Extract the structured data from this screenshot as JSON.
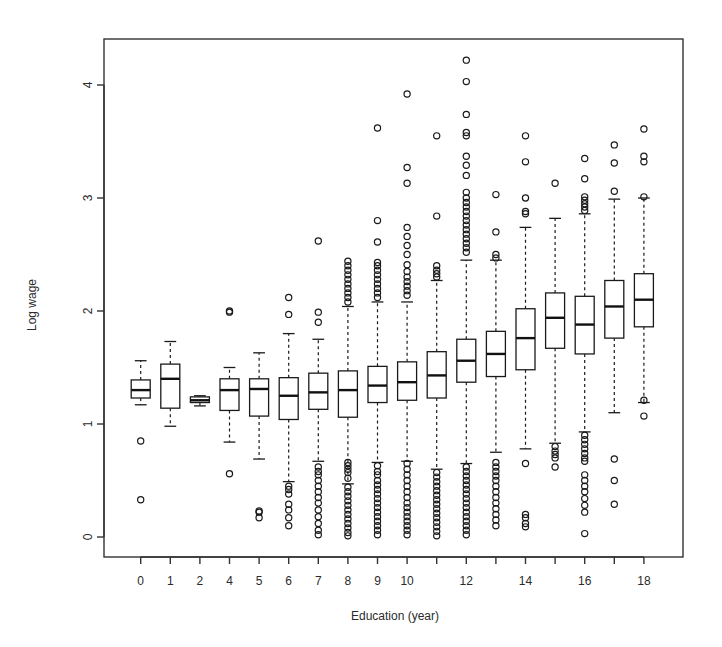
{
  "chart_data": {
    "type": "box",
    "title": "",
    "xlabel": "Education (year)",
    "ylabel": "Log wage",
    "grid": false,
    "legend": "none",
    "xlim": [
      -0.6,
      17.6
    ],
    "ylim": [
      -0.12,
      4.4
    ],
    "ytick_values": [
      0,
      1,
      2,
      3,
      4
    ],
    "ytick_labels": [
      "0",
      "1",
      "2",
      "3",
      "4"
    ],
    "categories": [
      "0",
      "1",
      "2",
      "4",
      "5",
      "6",
      "7",
      "8",
      "9",
      "10",
      "11",
      "12",
      "13",
      "14",
      "15",
      "16",
      "17",
      "18"
    ],
    "xtick_labels_shown": [
      "0",
      "1",
      "2",
      "4",
      "5",
      "6",
      "7",
      "8",
      "9",
      "10",
      "",
      "12",
      "",
      "14",
      "",
      "16",
      "",
      "18"
    ],
    "boxes": [
      {
        "category": "0",
        "whisker_low": 1.17,
        "q1": 1.23,
        "median": 1.3,
        "q3": 1.39,
        "whisker_high": 1.56,
        "outliers": [
          0.85,
          0.33
        ]
      },
      {
        "category": "1",
        "whisker_low": 0.98,
        "q1": 1.14,
        "median": 1.4,
        "q3": 1.53,
        "whisker_high": 1.73,
        "outliers": []
      },
      {
        "category": "2",
        "whisker_low": 1.16,
        "q1": 1.19,
        "median": 1.21,
        "q3": 1.24,
        "whisker_high": 1.25,
        "outliers": []
      },
      {
        "category": "4",
        "whisker_low": 0.84,
        "q1": 1.12,
        "median": 1.3,
        "q3": 1.4,
        "whisker_high": 1.5,
        "outliers": [
          2.0,
          1.99,
          0.56
        ]
      },
      {
        "category": "5",
        "whisker_low": 0.69,
        "q1": 1.07,
        "median": 1.31,
        "q3": 1.4,
        "whisker_high": 1.63,
        "outliers": [
          0.23,
          0.22,
          0.17
        ]
      },
      {
        "category": "6",
        "whisker_low": 0.49,
        "q1": 1.04,
        "median": 1.25,
        "q3": 1.41,
        "whisker_high": 1.8,
        "outliers": [
          2.12,
          1.97,
          0.45,
          0.42,
          0.38,
          0.29,
          0.24,
          0.17,
          0.1
        ]
      },
      {
        "category": "7",
        "whisker_low": 0.67,
        "q1": 1.13,
        "median": 1.28,
        "q3": 1.45,
        "whisker_high": 1.75,
        "outliers": [
          2.62,
          1.99,
          1.9,
          0.62,
          0.58,
          0.55,
          0.5,
          0.45,
          0.4,
          0.35,
          0.3,
          0.24,
          0.18,
          0.12,
          0.06,
          0.02
        ]
      },
      {
        "category": "8",
        "whisker_low": 0.47,
        "q1": 1.06,
        "median": 1.3,
        "q3": 1.47,
        "whisker_high": 2.04,
        "outliers": [
          2.44,
          2.4,
          2.36,
          2.32,
          2.28,
          2.24,
          2.2,
          2.16,
          2.12,
          2.08,
          0.66,
          0.63,
          0.6,
          0.57,
          0.52,
          0.44,
          0.4,
          0.36,
          0.32,
          0.28,
          0.24,
          0.2,
          0.16,
          0.12,
          0.08,
          0.04,
          0.01
        ]
      },
      {
        "category": "9",
        "whisker_low": 0.66,
        "q1": 1.19,
        "median": 1.34,
        "q3": 1.51,
        "whisker_high": 2.08,
        "outliers": [
          3.62,
          2.8,
          2.61,
          2.43,
          2.4,
          2.36,
          2.32,
          2.28,
          2.24,
          2.2,
          2.16,
          2.12,
          0.63,
          0.58,
          0.55,
          0.5,
          0.46,
          0.42,
          0.38,
          0.34,
          0.3,
          0.26,
          0.22,
          0.18,
          0.14,
          0.1,
          0.06,
          0.02
        ]
      },
      {
        "category": "10",
        "whisker_low": 0.67,
        "q1": 1.21,
        "median": 1.37,
        "q3": 1.55,
        "whisker_high": 2.08,
        "outliers": [
          3.92,
          3.27,
          3.13,
          2.74,
          2.66,
          2.58,
          2.5,
          2.41,
          2.35,
          2.3,
          2.26,
          2.22,
          2.18,
          2.14,
          0.65,
          0.6,
          0.55,
          0.5,
          0.45,
          0.4,
          0.35,
          0.3,
          0.26,
          0.22,
          0.18,
          0.14,
          0.1,
          0.06,
          0.02
        ]
      },
      {
        "category": "11",
        "whisker_low": 0.6,
        "q1": 1.23,
        "median": 1.43,
        "q3": 1.64,
        "whisker_high": 2.27,
        "outliers": [
          3.55,
          2.84,
          2.4,
          2.36,
          2.33,
          2.3,
          0.57,
          0.53,
          0.49,
          0.45,
          0.41,
          0.37,
          0.33,
          0.29,
          0.25,
          0.21,
          0.17,
          0.13,
          0.09,
          0.05,
          0.01
        ]
      },
      {
        "category": "12",
        "whisker_low": 0.65,
        "q1": 1.37,
        "median": 1.56,
        "q3": 1.75,
        "whisker_high": 2.45,
        "outliers": [
          4.22,
          4.03,
          3.74,
          3.58,
          3.55,
          3.37,
          3.29,
          3.2,
          3.05,
          3.0,
          2.96,
          2.92,
          2.88,
          2.84,
          2.8,
          2.76,
          2.72,
          2.68,
          2.64,
          2.6,
          2.56,
          2.52,
          0.62,
          0.58,
          0.54,
          0.5,
          0.46,
          0.42,
          0.38,
          0.34,
          0.3,
          0.26,
          0.22,
          0.18,
          0.14,
          0.1,
          0.06,
          0.02
        ]
      },
      {
        "category": "13",
        "whisker_low": 0.75,
        "q1": 1.42,
        "median": 1.62,
        "q3": 1.82,
        "whisker_high": 2.45,
        "outliers": [
          3.03,
          2.7,
          2.5,
          2.47,
          0.66,
          0.62,
          0.58,
          0.54,
          0.5,
          0.45,
          0.4,
          0.35,
          0.3,
          0.25,
          0.2,
          0.15,
          0.1
        ]
      },
      {
        "category": "14",
        "whisker_low": 0.78,
        "q1": 1.48,
        "median": 1.76,
        "q3": 2.02,
        "whisker_high": 2.74,
        "outliers": [
          3.55,
          3.32,
          3.0,
          2.88,
          2.86,
          0.65,
          0.2,
          0.17,
          0.12,
          0.09
        ]
      },
      {
        "category": "15",
        "whisker_low": 0.83,
        "q1": 1.67,
        "median": 1.94,
        "q3": 2.16,
        "whisker_high": 2.82,
        "outliers": [
          3.13,
          0.8,
          0.76,
          0.73,
          0.7,
          0.62
        ]
      },
      {
        "category": "16",
        "whisker_low": 0.93,
        "q1": 1.62,
        "median": 1.88,
        "q3": 2.13,
        "whisker_high": 2.86,
        "outliers": [
          3.35,
          3.17,
          3.01,
          2.98,
          2.95,
          2.92,
          2.89,
          0.9,
          0.86,
          0.82,
          0.78,
          0.74,
          0.7,
          0.67,
          0.55,
          0.5,
          0.45,
          0.4,
          0.34,
          0.28,
          0.22,
          0.03
        ]
      },
      {
        "category": "17",
        "whisker_low": 1.1,
        "q1": 1.76,
        "median": 2.04,
        "q3": 2.27,
        "whisker_high": 2.99,
        "outliers": [
          3.47,
          3.31,
          3.06,
          0.69,
          0.5,
          0.29
        ]
      },
      {
        "category": "18",
        "whisker_low": 1.19,
        "q1": 1.86,
        "median": 2.1,
        "q3": 2.33,
        "whisker_high": 3.0,
        "outliers": [
          3.61,
          3.37,
          3.32,
          3.01,
          1.21,
          1.07
        ]
      }
    ]
  }
}
